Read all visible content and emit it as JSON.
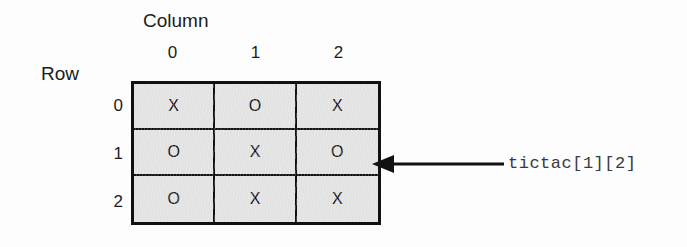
{
  "figure": {
    "column_caption": "Column",
    "row_caption": "Row",
    "column_ticks": [
      "0",
      "1",
      "2"
    ],
    "row_ticks": [
      "0",
      "1",
      "2"
    ],
    "grid": [
      [
        "X",
        "O",
        "X"
      ],
      [
        "O",
        "X",
        "O"
      ],
      [
        "O",
        "X",
        "X"
      ]
    ],
    "callout": {
      "label": "tictac[1][2]",
      "target_row": 1,
      "target_col": 2,
      "arrow": "left-arrow-icon"
    },
    "colors": {
      "cell_fill": "#e2e2e2",
      "grid_line": "#111111",
      "text": "#1c1c1c",
      "callout_text": "#3a3a3a",
      "background": "#fdfdfd"
    }
  }
}
